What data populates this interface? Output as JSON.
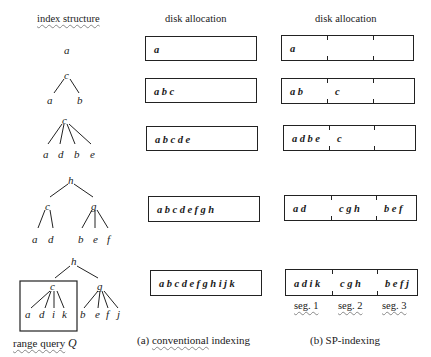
{
  "headers": {
    "index_structure": "index structure",
    "disk_allocation_a": "disk allocation",
    "disk_allocation_b": "disk allocation"
  },
  "trees": [
    {
      "nodes": [
        "a"
      ]
    },
    {
      "root": "c",
      "children": [
        "a",
        "b"
      ]
    },
    {
      "root": "c",
      "children": [
        "a",
        "d",
        "b",
        "e"
      ]
    },
    {
      "root": "h",
      "children": [
        {
          "node": "c",
          "children": [
            "a",
            "d"
          ]
        },
        {
          "node": "g",
          "children": [
            "b",
            "e",
            "f"
          ]
        }
      ]
    },
    {
      "root": "h",
      "children": [
        {
          "node": "c",
          "children": [
            "a",
            "d",
            "i",
            "k"
          ]
        },
        {
          "node": "g",
          "children": [
            "b",
            "e",
            "f",
            "j"
          ]
        }
      ]
    }
  ],
  "tree_labels": {
    "t1": {
      "a": "a"
    },
    "t2": {
      "c": "c",
      "a": "a",
      "b": "b"
    },
    "t3": {
      "c": "c",
      "a": "a",
      "d": "d",
      "b": "b",
      "e": "e"
    },
    "t4": {
      "h": "h",
      "c": "c",
      "g": "g",
      "a": "a",
      "d": "d",
      "b": "b",
      "e": "e",
      "f": "f"
    },
    "t5": {
      "h": "h",
      "c": "c",
      "g": "g",
      "a": "a",
      "d": "d",
      "i": "i",
      "k": "k",
      "b": "b",
      "e": "e",
      "f": "f",
      "j": "j"
    }
  },
  "conventional": [
    "a",
    "abc",
    "abcde",
    "abcdefgh",
    "abcdefghijk"
  ],
  "sp": [
    [
      "a",
      "",
      ""
    ],
    [
      "ab",
      "c",
      ""
    ],
    [
      "adbe",
      "c",
      ""
    ],
    [
      "ad",
      "cgh",
      "bef"
    ],
    [
      "adik",
      "cgh",
      "befj"
    ]
  ],
  "segment_labels": [
    "seg. 1",
    "seg. 2",
    "seg. 3"
  ],
  "range_query_label": "range query",
  "range_query_symbol": "Q",
  "captions": {
    "a_prefix": "(a) ",
    "a_word": "conventional",
    "a_rest": " indexing",
    "b": "(b) SP-indexing"
  }
}
